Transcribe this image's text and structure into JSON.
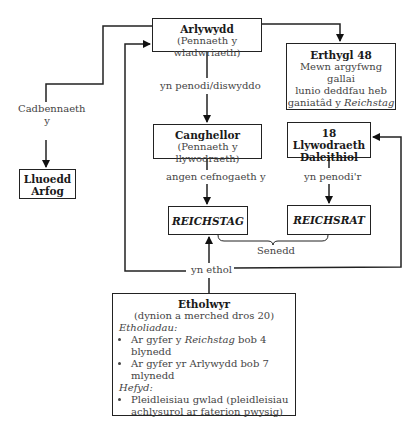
{
  "diagram": {
    "arlywydd": {
      "title": "Arlywydd",
      "subtitle": "(Pennaeth y wladwriaeth)"
    },
    "erthygl": {
      "title": "Erthygl 48",
      "line1": "Mewn argyfwng gallai",
      "line2": "lunio deddfau heb",
      "line3_prefix": "ganiatâd y ",
      "line3_italic": "Reichstag"
    },
    "cadbennaeth": {
      "line1": "Cadbennaeth",
      "line2": "y"
    },
    "lluoedd": {
      "line1": "Lluoedd",
      "line2": "Arfog"
    },
    "penodi_label": "yn penodi/diswyddo",
    "canghellor": {
      "title": "Canghellor",
      "subtitle": "(Pennaeth y llywodraeth)"
    },
    "llywodraeth": {
      "line1": "18 Llywodraeth",
      "line2": "Daleithiol"
    },
    "cefnogaeth_label": "angen cefnogaeth y",
    "penodir_label": "yn penodi'r",
    "reichstag": {
      "title": "REICHSTAG"
    },
    "reichsrat": {
      "title": "REICHSRAT"
    },
    "senedd_label": "Senedd",
    "ethol_label": "yn ethol",
    "etholwyr": {
      "title": "Etholwyr",
      "subtitle": "(dynion a merched dros 20)",
      "section1": "Etholiadau:",
      "bullet1_prefix": "Ar gyfer y ",
      "bullet1_italic": "Reichstag",
      "bullet1_suffix": " bob 4 blynedd",
      "bullet2": "Ar gyfer yr Arlywydd bob 7 mlynedd",
      "section2": "Hefyd:",
      "bullet3_line1": "Pleidleisiau gwlad (pleidleisiau",
      "bullet3_line2": "achlysurol ar faterion pwysig)"
    }
  }
}
